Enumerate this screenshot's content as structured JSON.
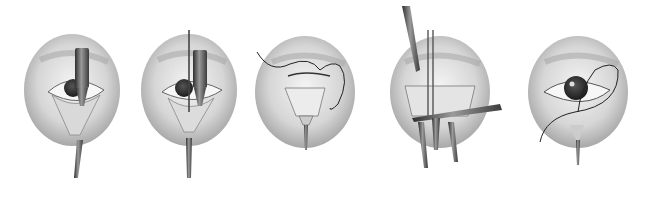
{
  "figure": {
    "type": "surgical-illustration-sequence",
    "background": "#ffffff",
    "panel_count": 5,
    "panels": [
      {
        "index": 1,
        "cx": 72,
        "cy": 90,
        "rx": 48,
        "ry": 56,
        "instruments": [
          "retractor",
          "cautery-probe"
        ],
        "suture": false
      },
      {
        "index": 2,
        "cx": 189,
        "cy": 90,
        "rx": 48,
        "ry": 56,
        "instruments": [
          "retractor",
          "cautery-probe",
          "needle"
        ],
        "suture": false
      },
      {
        "index": 3,
        "cx": 305,
        "cy": 92,
        "rx": 50,
        "ry": 56,
        "instruments": [
          "retractor"
        ],
        "suture": true
      },
      {
        "index": 4,
        "cx": 440,
        "cy": 92,
        "rx": 50,
        "ry": 56,
        "instruments": [
          "forceps",
          "scissors",
          "retractor",
          "retractor"
        ],
        "suture": false
      },
      {
        "index": 5,
        "cx": 578,
        "cy": 92,
        "rx": 50,
        "ry": 56,
        "instruments": [
          "retractor"
        ],
        "suture": true
      }
    ],
    "colors": {
      "skin_light": "#e8e8e8",
      "skin_mid": "#bdbdbd",
      "skin_dark": "#8a8a8a",
      "instrument": "#5a5a5a",
      "iris": "#3a3a3a",
      "suture": "#222222"
    }
  }
}
